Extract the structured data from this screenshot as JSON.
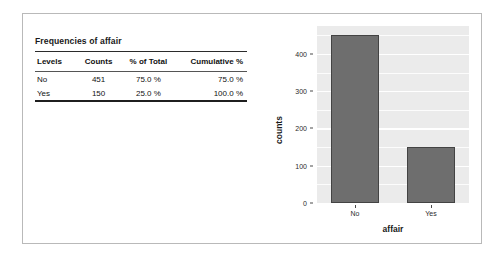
{
  "panel": {
    "table": {
      "title": "Frequencies of affair",
      "columns": [
        "Levels",
        "Counts",
        "% of Total",
        "Cumulative %"
      ],
      "rows": [
        {
          "level": "No",
          "counts": "451",
          "pct_of_total": "75.0 %",
          "cumulative": "75.0 %"
        },
        {
          "level": "Yes",
          "counts": "150",
          "pct_of_total": "25.0 %",
          "cumulative": "100.0 %"
        }
      ]
    }
  },
  "chart_data": {
    "type": "bar",
    "title": "",
    "categories": [
      "No",
      "Yes"
    ],
    "values": [
      451,
      150
    ],
    "xlabel": "affair",
    "ylabel": "counts",
    "ylim": [
      0,
      475
    ],
    "yticks": [
      0,
      100,
      200,
      300,
      400
    ],
    "ytick_labels": [
      "0",
      "100",
      "200",
      "300",
      "400"
    ],
    "grid": true,
    "legend": "none",
    "panel_background": "#ebebeb",
    "gridline_color": "#ffffff",
    "bar_fill": "#6e6e6e",
    "bar_border": "#434343"
  }
}
